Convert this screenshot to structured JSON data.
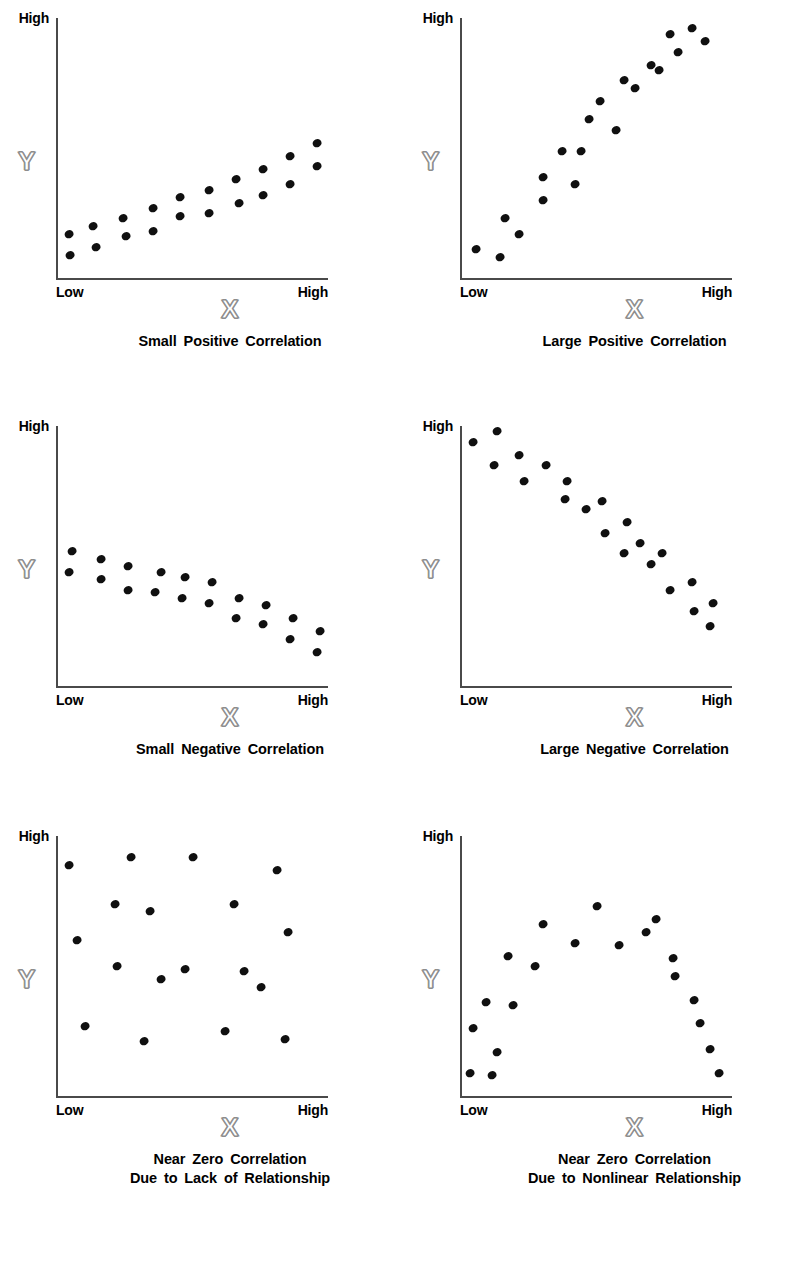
{
  "figure": {
    "axis_labels": {
      "x": "X",
      "y": "Y"
    },
    "tick_labels": {
      "y_high": "High",
      "x_low": "Low",
      "x_high": "High"
    },
    "dot_color": "#101010",
    "axis_color": "#4a4a4a",
    "axis_name_outline_color": "#8d8d8d",
    "background": "#ffffff"
  },
  "chart_data": [
    {
      "type": "scatter",
      "title": "Small Positive Correlation",
      "caption_lines": [
        "Small Positive Correlation"
      ],
      "xlabel": "X",
      "ylabel": "Y",
      "xlim": [
        0,
        100
      ],
      "ylim": [
        0,
        100
      ],
      "xtick_labels": [
        "Low",
        "High"
      ],
      "ytick_labels": [
        "High"
      ],
      "grid": false,
      "legend": "none",
      "points": [
        [
          4,
          17
        ],
        [
          4.5,
          9
        ],
        [
          13,
          20
        ],
        [
          14,
          12
        ],
        [
          24,
          23
        ],
        [
          25,
          16
        ],
        [
          35,
          27
        ],
        [
          35,
          18
        ],
        [
          45,
          31
        ],
        [
          45,
          24
        ],
        [
          56,
          34
        ],
        [
          56,
          25
        ],
        [
          66,
          38
        ],
        [
          67,
          29
        ],
        [
          76,
          42
        ],
        [
          76,
          32
        ],
        [
          86,
          47
        ],
        [
          86,
          36
        ],
        [
          96,
          52
        ],
        [
          96,
          43
        ]
      ]
    },
    {
      "type": "scatter",
      "title": "Large Positive Correlation",
      "caption_lines": [
        "Large Positive Correlation"
      ],
      "xlabel": "X",
      "ylabel": "Y",
      "xlim": [
        0,
        100
      ],
      "ylim": [
        0,
        100
      ],
      "xtick_labels": [
        "Low",
        "High"
      ],
      "ytick_labels": [
        "High"
      ],
      "grid": false,
      "legend": "none",
      "points": [
        [
          5,
          11
        ],
        [
          14,
          8
        ],
        [
          16,
          23
        ],
        [
          21,
          17
        ],
        [
          30,
          30
        ],
        [
          30,
          39
        ],
        [
          37,
          49
        ],
        [
          42,
          36
        ],
        [
          44,
          49
        ],
        [
          47,
          61
        ],
        [
          51,
          68
        ],
        [
          57,
          57
        ],
        [
          60,
          76
        ],
        [
          64,
          73
        ],
        [
          70,
          82
        ],
        [
          73,
          80
        ],
        [
          77,
          94
        ],
        [
          80,
          87
        ],
        [
          85,
          96
        ],
        [
          90,
          91
        ]
      ]
    },
    {
      "type": "scatter",
      "title": "Small Negative Correlation",
      "caption_lines": [
        "Small Negative Correlation"
      ],
      "xlabel": "X",
      "ylabel": "Y",
      "xlim": [
        0,
        100
      ],
      "ylim": [
        0,
        100
      ],
      "xtick_labels": [
        "Low",
        "High"
      ],
      "ytick_labels": [
        "High"
      ],
      "grid": false,
      "legend": "none",
      "points": [
        [
          5,
          52
        ],
        [
          4,
          44
        ],
        [
          16,
          49
        ],
        [
          16,
          41
        ],
        [
          26,
          46
        ],
        [
          26,
          37
        ],
        [
          36,
          36
        ],
        [
          38,
          44
        ],
        [
          46,
          34
        ],
        [
          47,
          42
        ],
        [
          56,
          32
        ],
        [
          57,
          40
        ],
        [
          66,
          26
        ],
        [
          67,
          34
        ],
        [
          76,
          24
        ],
        [
          77,
          31
        ],
        [
          86,
          18
        ],
        [
          87,
          26
        ],
        [
          96,
          13
        ],
        [
          97,
          21
        ]
      ]
    },
    {
      "type": "scatter",
      "title": "Large Negative Correlation",
      "caption_lines": [
        "Large Negative Correlation"
      ],
      "xlabel": "X",
      "ylabel": "Y",
      "xlim": [
        0,
        100
      ],
      "ylim": [
        0,
        100
      ],
      "xtick_labels": [
        "Low",
        "High"
      ],
      "ytick_labels": [
        "High"
      ],
      "grid": false,
      "legend": "none",
      "points": [
        [
          4,
          94
        ],
        [
          13,
          98
        ],
        [
          12,
          85
        ],
        [
          21,
          89
        ],
        [
          23,
          79
        ],
        [
          31,
          85
        ],
        [
          38,
          72
        ],
        [
          39,
          79
        ],
        [
          46,
          68
        ],
        [
          52,
          71
        ],
        [
          53,
          59
        ],
        [
          61,
          63
        ],
        [
          60,
          51
        ],
        [
          66,
          55
        ],
        [
          70,
          47
        ],
        [
          74,
          51
        ],
        [
          77,
          37
        ],
        [
          85,
          40
        ],
        [
          86,
          29
        ],
        [
          93,
          32
        ],
        [
          92,
          23
        ]
      ]
    },
    {
      "type": "scatter",
      "title": "Near Zero Correlation Due to Lack of Relationship",
      "caption_lines": [
        "Near Zero Correlation",
        "Due to Lack of Relationship"
      ],
      "xlabel": "X",
      "ylabel": "Y",
      "xlim": [
        0,
        100
      ],
      "ylim": [
        0,
        100
      ],
      "xtick_labels": [
        "Low",
        "High"
      ],
      "ytick_labels": [
        "High"
      ],
      "grid": false,
      "legend": "none",
      "points": [
        [
          4,
          89
        ],
        [
          27,
          92
        ],
        [
          50,
          92
        ],
        [
          81,
          87
        ],
        [
          21,
          74
        ],
        [
          34,
          71
        ],
        [
          65,
          74
        ],
        [
          85,
          63
        ],
        [
          7,
          60
        ],
        [
          22,
          50
        ],
        [
          47,
          49
        ],
        [
          69,
          48
        ],
        [
          38,
          45
        ],
        [
          75,
          42
        ],
        [
          10,
          27
        ],
        [
          32,
          21
        ],
        [
          62,
          25
        ],
        [
          84,
          22
        ]
      ]
    },
    {
      "type": "scatter",
      "title": "Near Zero Correlation Due to Nonlinear Relationship",
      "caption_lines": [
        "Near Zero Correlation",
        "Due to Nonlinear Relationship"
      ],
      "xlabel": "X",
      "ylabel": "Y",
      "xlim": [
        0,
        100
      ],
      "ylim": [
        0,
        100
      ],
      "xtick_labels": [
        "Low",
        "High"
      ],
      "ytick_labels": [
        "High"
      ],
      "grid": false,
      "legend": "none",
      "points": [
        [
          3,
          9
        ],
        [
          11,
          8
        ],
        [
          4,
          26
        ],
        [
          13,
          17
        ],
        [
          9,
          36
        ],
        [
          19,
          35
        ],
        [
          17,
          54
        ],
        [
          27,
          50
        ],
        [
          30,
          66
        ],
        [
          42,
          59
        ],
        [
          50,
          73
        ],
        [
          58,
          58
        ],
        [
          68,
          63
        ],
        [
          72,
          68
        ],
        [
          78,
          53
        ],
        [
          79,
          46
        ],
        [
          86,
          37
        ],
        [
          88,
          28
        ],
        [
          92,
          18
        ],
        [
          95,
          9
        ]
      ]
    }
  ]
}
